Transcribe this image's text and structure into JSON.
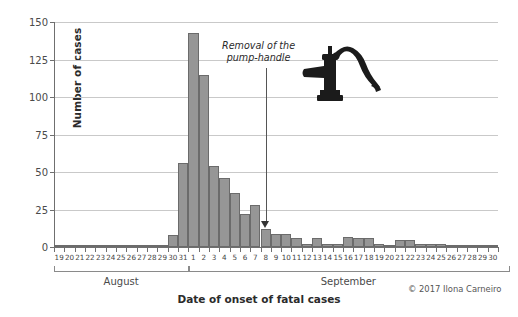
{
  "chart_data": {
    "type": "bar",
    "title": "",
    "subtitle": "",
    "xlabel": "Date of onset of fatal cases",
    "ylabel": "Number of cases",
    "ylim": [
      0,
      150
    ],
    "yticks": [
      0,
      25,
      50,
      75,
      100,
      125,
      150
    ],
    "ytick_labels": [
      "0",
      "25",
      "50",
      "75",
      "100",
      "125",
      "150"
    ],
    "grid": "horizontal",
    "legend": "none",
    "bar_color": "#969696",
    "bar_edge_color": "#6b6b6b",
    "categories": [
      "19",
      "20",
      "21",
      "22",
      "23",
      "24",
      "25",
      "26",
      "27",
      "28",
      "29",
      "30",
      "31",
      "1",
      "2",
      "3",
      "4",
      "5",
      "6",
      "7",
      "8",
      "9",
      "10",
      "11",
      "12",
      "13",
      "14",
      "15",
      "16",
      "17",
      "18",
      "19",
      "20",
      "21",
      "22",
      "23",
      "24",
      "25",
      "26",
      "27",
      "28",
      "29",
      "30"
    ],
    "values": [
      1,
      1,
      1,
      0,
      1,
      1,
      1,
      0,
      1,
      1,
      1,
      8,
      56,
      143,
      115,
      54,
      46,
      36,
      22,
      28,
      12,
      9,
      9,
      6,
      2,
      6,
      2,
      2,
      7,
      6,
      6,
      2,
      1,
      5,
      5,
      2,
      2,
      2,
      1,
      1,
      1,
      1,
      1
    ],
    "groups": [
      {
        "label": "August",
        "start_index": 0,
        "end_index": 12
      },
      {
        "label": "September",
        "start_index": 13,
        "end_index": 43
      }
    ],
    "annotations": [
      {
        "text_line1": "Removal of the",
        "text_line2": "pump-handle",
        "target_category": "8",
        "target_month": "September",
        "arrow": "down"
      }
    ],
    "icons": [
      {
        "name": "water-pump-illustration"
      }
    ]
  },
  "footer": {
    "copyright": "© 2017 Ilona Carneiro"
  }
}
